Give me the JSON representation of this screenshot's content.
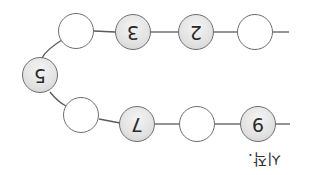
{
  "diagram": {
    "orientation": "rotated 180 degrees",
    "caption": "시작.",
    "colors": {
      "line": "#5a5a5a",
      "filled_node": "#e2e2e2",
      "empty_node": "#ffffff",
      "border": "#6d6d6d"
    },
    "top_row": [
      {
        "value": "",
        "filled": false
      },
      {
        "value": "3",
        "filled": true
      },
      {
        "value": "2",
        "filled": true
      },
      {
        "value": "",
        "filled": false
      }
    ],
    "left_node": {
      "value": "5",
      "filled": true
    },
    "bottom_row": [
      {
        "value": "",
        "filled": false
      },
      {
        "value": "7",
        "filled": true
      },
      {
        "value": "",
        "filled": false
      },
      {
        "value": "9",
        "filled": true
      }
    ]
  }
}
